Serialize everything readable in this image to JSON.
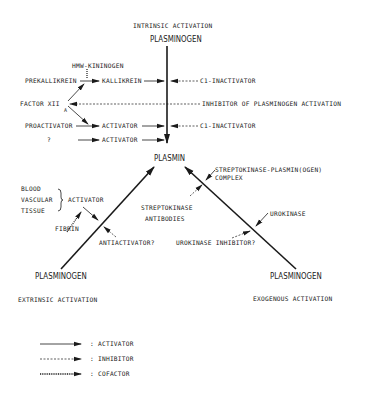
{
  "top": {
    "heading": "INTRINSIC ACTIVATION",
    "plasminogen": "PLASMINOGEN",
    "hmw_kininogen": "HMW-KININOGEN",
    "prekallikrein": "PREKALLIKREIN",
    "kallikrein": "KALLIKREIN",
    "factor_xii": "FACTOR XII",
    "factor_sub": "A",
    "proactivator": "PROACTIVATOR",
    "activator1": "ACTIVATOR",
    "unknown": "?",
    "activator2": "ACTIVATOR",
    "c1_inactivator_1": "C1-INACTIVATOR",
    "inhibitor_pa": "INHIBITOR OF PLASMINOGEN ACTIVATION",
    "c1_inactivator_2": "C1-INACTIVATOR"
  },
  "center": {
    "plasmin": "PLASMIN",
    "sk_complex_1": "STREPTOKINASE-PLASMIN(OGEN)",
    "sk_complex_2": "COMPLEX",
    "sk_antibodies_1": "STREPTOKINASE",
    "sk_antibodies_2": "ANTIBODIES"
  },
  "left": {
    "blood": "BLOOD",
    "vascular": "VASCULAR",
    "tissue": "TISSUE",
    "activator": "ACTIVATOR",
    "fibrin": "FIBRIN",
    "antiactivator": "ANTIACTIVATOR?",
    "plasminogen": "PLASMINOGEN",
    "heading": "EXTRINSIC ACTIVATION"
  },
  "right": {
    "urokinase": "UROKINASE",
    "urokinase_inhibitor": "UROKINASE INHIBITOR?",
    "plasminogen": "PLASMINOGEN",
    "heading": "EXOGENOUS ACTIVATION"
  },
  "legend": {
    "items": [
      {
        "style": "solid",
        "label": ": ACTIVATOR"
      },
      {
        "style": "dashed",
        "label": ": INHIBITOR"
      },
      {
        "style": "dotted",
        "label": ": COFACTOR"
      }
    ]
  }
}
